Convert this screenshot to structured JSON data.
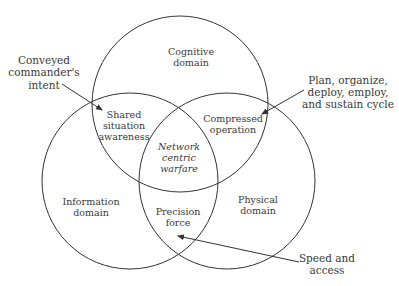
{
  "diagram": {
    "type": "venn",
    "circles": [
      {
        "id": "cognitive",
        "label_line1": "Cognitive",
        "label_line2": "domain",
        "cx": 180,
        "cy": 104,
        "r": 88
      },
      {
        "id": "information",
        "label_line1": "Information",
        "label_line2": "domain",
        "cx": 130,
        "cy": 181,
        "r": 88
      },
      {
        "id": "physical",
        "label_line1": "Physical",
        "label_line2": "domain",
        "cx": 227,
        "cy": 181,
        "r": 88
      }
    ],
    "intersections": {
      "cognitive_information": {
        "line1": "Shared",
        "line2": "situation",
        "line3": "awareness"
      },
      "cognitive_physical": {
        "line1": "Compressed",
        "line2": "operation"
      },
      "information_physical": {
        "line1": "Precision",
        "line2": "force"
      },
      "center": {
        "line1": "Network",
        "line2": "centric",
        "line3": "warfare"
      }
    },
    "annotations": {
      "intent": {
        "line1": "Conveyed",
        "line2": "commander's",
        "line3": "intent"
      },
      "cycle": {
        "line1": "Plan, organize,",
        "line2": "deploy, employ,",
        "line3": "and sustain cycle"
      },
      "speed": {
        "line1": "Speed and",
        "line2": "access"
      }
    },
    "colors": {
      "stroke": "#333333",
      "text": "#3a3a3a",
      "background": "#ffffff"
    }
  }
}
